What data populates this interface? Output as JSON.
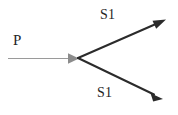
{
  "figure": {
    "type": "ray-splitting-diagram",
    "background_color": "#ffffff",
    "incident": {
      "label": "P",
      "line_color": "#9a9a9a",
      "arrowhead_color": "#8c8c8c",
      "stroke_width": 1,
      "start": {
        "x": 8,
        "y": 58
      },
      "end": {
        "x": 78,
        "y": 58
      }
    },
    "vertex": {
      "x": 78,
      "y": 58
    },
    "rays": [
      {
        "label": "S1",
        "direction": "upper-right",
        "line_color": "#2b2b2b",
        "stroke_width": 2,
        "start": {
          "x": 78,
          "y": 58
        },
        "end": {
          "x": 164,
          "y": 20
        }
      },
      {
        "label": "S1",
        "direction": "lower-right",
        "line_color": "#2b2b2b",
        "stroke_width": 2,
        "start": {
          "x": 78,
          "y": 58
        },
        "end": {
          "x": 161,
          "y": 99
        }
      }
    ]
  }
}
